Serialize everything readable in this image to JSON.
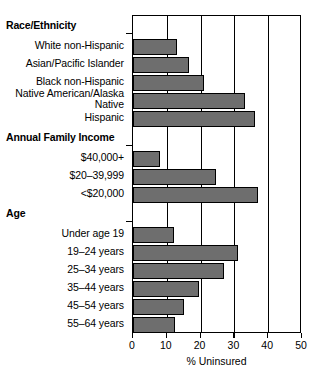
{
  "chart_data": {
    "type": "bar",
    "orientation": "horizontal",
    "title": "",
    "xlabel": "% Uninsured",
    "ylabel": "",
    "xlim": [
      0,
      50
    ],
    "xticks": [
      0,
      10,
      20,
      30,
      40,
      50
    ],
    "xticklabels": [
      "0",
      "10",
      "20",
      "30",
      "40",
      "50"
    ],
    "grid": "vertical",
    "legend": "none",
    "bar_color": "#6e6e6e",
    "groups": [
      {
        "name": "Race/Ethnicity",
        "categories": [
          "White non-Hispanic",
          "Asian/Pacific Islander",
          "Black non-Hispanic",
          "Native American/Alaska Native",
          "Hispanic"
        ],
        "values": [
          13,
          16.5,
          21,
          33,
          36
        ]
      },
      {
        "name": "Annual Family Income",
        "categories": [
          "$40,000+",
          "$20–39,999",
          "<$20,000"
        ],
        "values": [
          8,
          24.5,
          37
        ]
      },
      {
        "name": "Age",
        "categories": [
          "Under age 19",
          "19–24 years",
          "25–34 years",
          "35–44 years",
          "45–54 years",
          "55–64 years"
        ],
        "values": [
          12,
          31,
          27,
          19.5,
          15,
          12.5
        ]
      }
    ]
  }
}
